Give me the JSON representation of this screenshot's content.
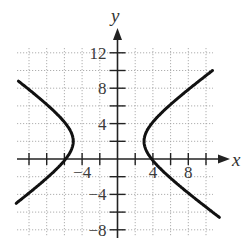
{
  "chart_data": {
    "type": "line",
    "title": "",
    "xlabel": "x",
    "ylabel": "y",
    "xlim": [
      -11.4,
      10.7
    ],
    "ylim": [
      -8.6,
      12.7
    ],
    "grid": true,
    "grid_step": 2,
    "x_ticks": [
      -4,
      4,
      8
    ],
    "x_tick_labels": [
      "−4",
      "4",
      "8"
    ],
    "y_ticks": [
      12,
      8,
      4,
      -4,
      -8
    ],
    "y_tick_labels": [
      "12",
      "8",
      "4",
      "−4",
      "−8"
    ],
    "curve": {
      "kind": "hyperbola",
      "equation": "(x+1)^2/16 - (y-2)^2/8.4 = 1",
      "center": [
        -1,
        2
      ],
      "a": 4,
      "b": 2.9,
      "branches": [
        {
          "name": "left",
          "vertex": [
            -5,
            2
          ],
          "y_range": [
            -5,
            8.8
          ]
        },
        {
          "name": "right",
          "vertex": [
            3,
            2
          ],
          "y_range": [
            -6.6,
            10
          ]
        }
      ]
    }
  },
  "colors": {
    "curve": "#111111",
    "axis": "#222222",
    "grid": "#9a9a9a",
    "text": "#3a3a3a"
  }
}
